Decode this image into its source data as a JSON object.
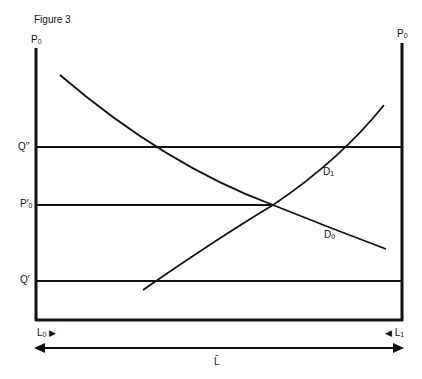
{
  "figure": {
    "title": "Figure 3",
    "left_axis_label": {
      "main": "P",
      "sub": "0"
    },
    "right_axis_label": {
      "main": "P",
      "sub": "0"
    },
    "y_labels": {
      "q_double_prime": "Q′′",
      "p_prime_0": {
        "main": "P′",
        "sub": "0"
      },
      "q_prime": "Q′"
    },
    "curve_labels": {
      "d1": {
        "main": "D",
        "sub": "1"
      },
      "d0": {
        "main": "D",
        "sub": "0"
      }
    },
    "x_labels": {
      "l0": {
        "main": "L",
        "sub": "0",
        "arrow": "▶"
      },
      "l1": {
        "main": "L",
        "sub": "1",
        "arrow": "◀"
      },
      "l_bar": "L̄"
    },
    "colors": {
      "line": "#111111",
      "background": "#ffffff"
    }
  }
}
